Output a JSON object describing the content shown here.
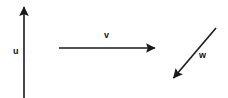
{
  "diagram": {
    "background_color": "#ffffff",
    "stroke_color": "#1a1a1a",
    "label_color": "#111111",
    "width": 228,
    "height": 98,
    "vectors": [
      {
        "id": "u",
        "label": "u",
        "direction": "up",
        "tail": {
          "x": 24,
          "y": 98
        },
        "tip": {
          "x": 24,
          "y": 4
        },
        "label_position": {
          "x": 13,
          "y": 47
        }
      },
      {
        "id": "v",
        "label": "v",
        "direction": "right",
        "tail": {
          "x": 59,
          "y": 48
        },
        "tip": {
          "x": 158,
          "y": 48
        },
        "label_position": {
          "x": 104,
          "y": 31
        }
      },
      {
        "id": "w",
        "label": "w",
        "direction": "down-left",
        "tail": {
          "x": 216,
          "y": 28
        },
        "tip": {
          "x": 170,
          "y": 82
        },
        "label_position": {
          "x": 199,
          "y": 51
        }
      }
    ]
  }
}
